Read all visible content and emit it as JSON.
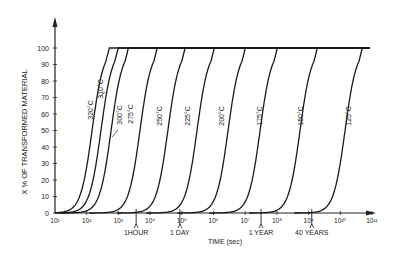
{
  "chart_data": {
    "type": "line",
    "title": "",
    "xlabel": "TIME (sec)",
    "ylabel": "X % OF TRANSFORMED MATERIAL",
    "xscale": "log",
    "xlim_log10": [
      1,
      11
    ],
    "ylim": [
      0,
      100
    ],
    "grid": false,
    "x_ticks": [
      "10¹",
      "10²",
      "10³",
      "10⁴",
      "10⁵",
      "10⁶",
      "10⁷",
      "10⁸",
      "10⁹",
      "10¹⁰",
      "10¹¹"
    ],
    "x_tick_values_log10": [
      1,
      2,
      3,
      4,
      5,
      6,
      7,
      8,
      9,
      10,
      11
    ],
    "y_ticks": [
      0,
      10,
      20,
      30,
      40,
      50,
      60,
      70,
      80,
      90,
      100
    ],
    "time_markers": [
      {
        "label": "1HOUR",
        "log10_seconds": 3.56
      },
      {
        "label": "1 DAY",
        "log10_seconds": 4.94
      },
      {
        "label": "1 YEAR",
        "log10_seconds": 7.5
      },
      {
        "label": "40 YEARS",
        "log10_seconds": 9.1
      }
    ],
    "series": [
      {
        "name": "320°C",
        "half_log10_seconds": 2.17,
        "width": 0.9
      },
      {
        "name": "310°C",
        "half_log10_seconds": 2.45,
        "width": 0.9
      },
      {
        "name": "300°C",
        "half_log10_seconds": 2.77,
        "width": 0.9
      },
      {
        "name": "275°C",
        "half_log10_seconds": 3.68,
        "width": 0.9
      },
      {
        "name": "250°C",
        "half_log10_seconds": 4.56,
        "width": 0.9
      },
      {
        "name": "225°C",
        "half_log10_seconds": 5.48,
        "width": 0.9
      },
      {
        "name": "200°C",
        "half_log10_seconds": 6.46,
        "width": 0.9
      },
      {
        "name": "175°C",
        "half_log10_seconds": 7.47,
        "width": 0.9
      },
      {
        "name": "150°C",
        "half_log10_seconds": 8.73,
        "width": 0.9
      },
      {
        "name": "125°C",
        "half_log10_seconds": 10.15,
        "width": 0.9
      }
    ],
    "curve_labels": [
      {
        "text": "320°C",
        "x": 93,
        "y": 110
      },
      {
        "text": "310°C",
        "x": 103,
        "y": 89,
        "leader": true
      },
      {
        "text": "300°C",
        "x": 122,
        "y": 115,
        "leader": true
      },
      {
        "text": "275°C",
        "x": 133,
        "y": 114
      },
      {
        "text": "250°C",
        "x": 162,
        "y": 116
      },
      {
        "text": "225°C",
        "x": 190,
        "y": 116
      },
      {
        "text": "200°C",
        "x": 224,
        "y": 116
      },
      {
        "text": "175°C",
        "x": 262,
        "y": 116
      },
      {
        "text": "150°C",
        "x": 303,
        "y": 116
      },
      {
        "text": "125°C",
        "x": 351,
        "y": 116
      }
    ]
  }
}
